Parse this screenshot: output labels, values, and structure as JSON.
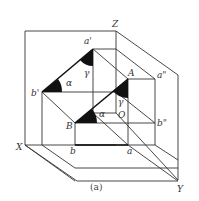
{
  "figure": {
    "caption": "(a)",
    "axes": {
      "x": "X",
      "y": "Y",
      "z": "Z",
      "origin": "O"
    },
    "points": {
      "a_prime": "a'",
      "b_prime": "b'",
      "a_double_prime": "a\"",
      "b_double_prime": "b\"",
      "A": "A",
      "B": "B",
      "a": "a",
      "b": "b"
    },
    "angles": {
      "alpha_front": "α",
      "gamma_front": "γ",
      "alpha_space": "α",
      "gamma_space": "γ"
    },
    "colors": {
      "line": "#333333",
      "thick_line": "#111111",
      "fill": "#111111"
    }
  }
}
